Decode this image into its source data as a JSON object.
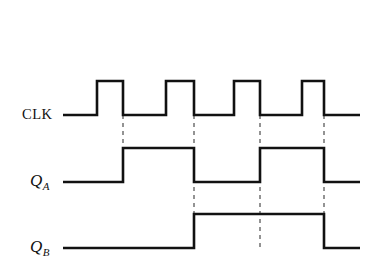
{
  "figure": {
    "type": "digital-timing-diagram",
    "background_color": "#ffffff",
    "line_color": "#111111",
    "dash_color": "#5a5a5a",
    "width": 388,
    "height": 272
  },
  "signals": [
    {
      "id": "clk",
      "label": "CLK",
      "label_x": 22,
      "label_y": 119,
      "low_y": 115,
      "high_y": 81,
      "start_x": 63,
      "end_x": 360,
      "initial_level": "low",
      "transitions": [
        97,
        123,
        166,
        194,
        234,
        260,
        302,
        324
      ]
    },
    {
      "id": "qa",
      "label_main": "Q",
      "label_sub": "A",
      "label_x": 30,
      "label_y": 186,
      "low_y": 182,
      "high_y": 148,
      "start_x": 63,
      "end_x": 360,
      "initial_level": "low",
      "transitions": [
        123,
        194,
        260,
        324
      ]
    },
    {
      "id": "qb",
      "label_main": "Q",
      "label_sub": "B",
      "label_x": 30,
      "label_y": 252,
      "low_y": 248,
      "high_y": 214,
      "start_x": 63,
      "end_x": 360,
      "initial_level": "low",
      "transitions": [
        194,
        324
      ]
    }
  ],
  "dashed_markers": [
    {
      "x": 123,
      "y_top": 115,
      "y_bottom": 182
    },
    {
      "x": 194,
      "y_top": 115,
      "y_bottom": 248
    },
    {
      "x": 260,
      "y_top": 115,
      "y_bottom": 248
    },
    {
      "x": 324,
      "y_top": 115,
      "y_bottom": 248
    }
  ],
  "chart_data": {
    "type": "line",
    "title": "",
    "xlabel": "",
    "ylabel": "",
    "time_unit": "clock cycle",
    "series": [
      {
        "name": "CLK",
        "levels": [
          0,
          1,
          0,
          1,
          0,
          1,
          0,
          1,
          0
        ],
        "edge_times_px": [
          63,
          97,
          123,
          166,
          194,
          234,
          260,
          302,
          324
        ]
      },
      {
        "name": "Q_A",
        "levels": [
          0,
          1,
          0,
          1,
          0
        ],
        "edge_times_px": [
          63,
          123,
          194,
          260,
          324
        ]
      },
      {
        "name": "Q_B",
        "levels": [
          0,
          1,
          0
        ],
        "edge_times_px": [
          63,
          194,
          324
        ]
      }
    ]
  }
}
